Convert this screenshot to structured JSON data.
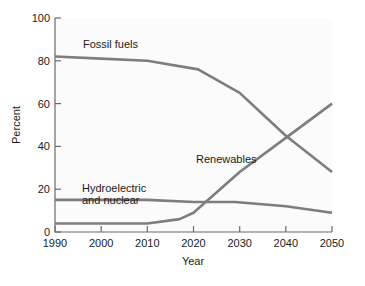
{
  "chart_data": {
    "type": "line",
    "title": "",
    "xlabel": "Year",
    "ylabel": "Percent",
    "xlim": [
      1990,
      2050
    ],
    "ylim": [
      0,
      100
    ],
    "grid": false,
    "legend_position": "inline-annotations",
    "x_ticks": [
      "1990",
      "2000",
      "2010",
      "2020",
      "2030",
      "2040",
      "2050"
    ],
    "x_tick_values": [
      1990,
      2000,
      2010,
      2020,
      2030,
      2040,
      2050
    ],
    "y_ticks": [
      "0",
      "20",
      "40",
      "60",
      "80",
      "100"
    ],
    "y_tick_values": [
      0,
      20,
      40,
      60,
      80,
      100
    ],
    "x": [
      1990,
      2000,
      2010,
      2020,
      2030,
      2040,
      2050
    ],
    "series": [
      {
        "name": "Fossil fuels",
        "color": "#7d7d7d",
        "values": [
          82,
          81,
          80,
          77,
          65,
          45,
          28
        ],
        "points": [
          [
            1990,
            82
          ],
          [
            2000,
            81
          ],
          [
            2010,
            80
          ],
          [
            2021,
            76
          ],
          [
            2030,
            65
          ],
          [
            2040,
            45
          ],
          [
            2050,
            28
          ]
        ],
        "label": "Fossil fuels",
        "label_x": 2003,
        "label_y": 88
      },
      {
        "name": "Hydroelectric and nuclear",
        "color": "#7d7d7d",
        "values": [
          15,
          15,
          15,
          14,
          14,
          12,
          9
        ],
        "points": [
          [
            1990,
            15
          ],
          [
            2010,
            15
          ],
          [
            2020,
            14
          ],
          [
            2029,
            14
          ],
          [
            2040,
            12
          ],
          [
            2050,
            9
          ]
        ],
        "label": "Hydroelectric\nand nuclear",
        "label_line_1": "Hydroelectric",
        "label_line_2": "and nuclear",
        "label_x": 1999,
        "label_y": 26
      },
      {
        "name": "Renewables",
        "color": "#7d7d7d",
        "values": [
          4,
          4,
          4,
          9,
          28,
          44,
          60
        ],
        "points": [
          [
            1990,
            4
          ],
          [
            2010,
            4
          ],
          [
            2017,
            6
          ],
          [
            2020,
            9
          ],
          [
            2030,
            28
          ],
          [
            2040,
            44
          ],
          [
            2050,
            60
          ]
        ],
        "label": "Renewables",
        "label_x": 2023,
        "label_y": 33
      }
    ],
    "annotations": [
      {
        "text": "Renewables overtakes Hydroelectric and nuclear",
        "x": 2023,
        "y": 14
      },
      {
        "text": "Renewables overtakes Fossil fuels",
        "x": 2041,
        "y": 42
      }
    ]
  },
  "colors": {
    "line": "#7d7d7d",
    "axis": "#6b6b6b",
    "text": "#1a1a1a",
    "plot_background": "#fbfbfb",
    "page_background": "#ffffff"
  },
  "axis": {
    "x_title": "Year",
    "y_title": "Percent"
  }
}
